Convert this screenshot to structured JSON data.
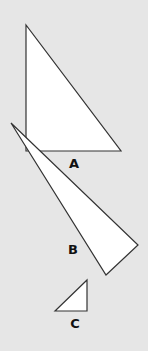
{
  "figure": {
    "background": "#e6e6e6",
    "fill": "#ffffff",
    "stroke": "#333333",
    "triangles": [
      {
        "label": "A",
        "points": "26,25 26,151 121,151",
        "label_x": 74,
        "label_y": 168
      },
      {
        "label": "B",
        "points": "11,123 138,245 106,275",
        "label_x": 73,
        "label_y": 254
      },
      {
        "label": "C",
        "points": "55,311 87,280 87,311",
        "label_x": 75,
        "label_y": 328
      }
    ]
  }
}
